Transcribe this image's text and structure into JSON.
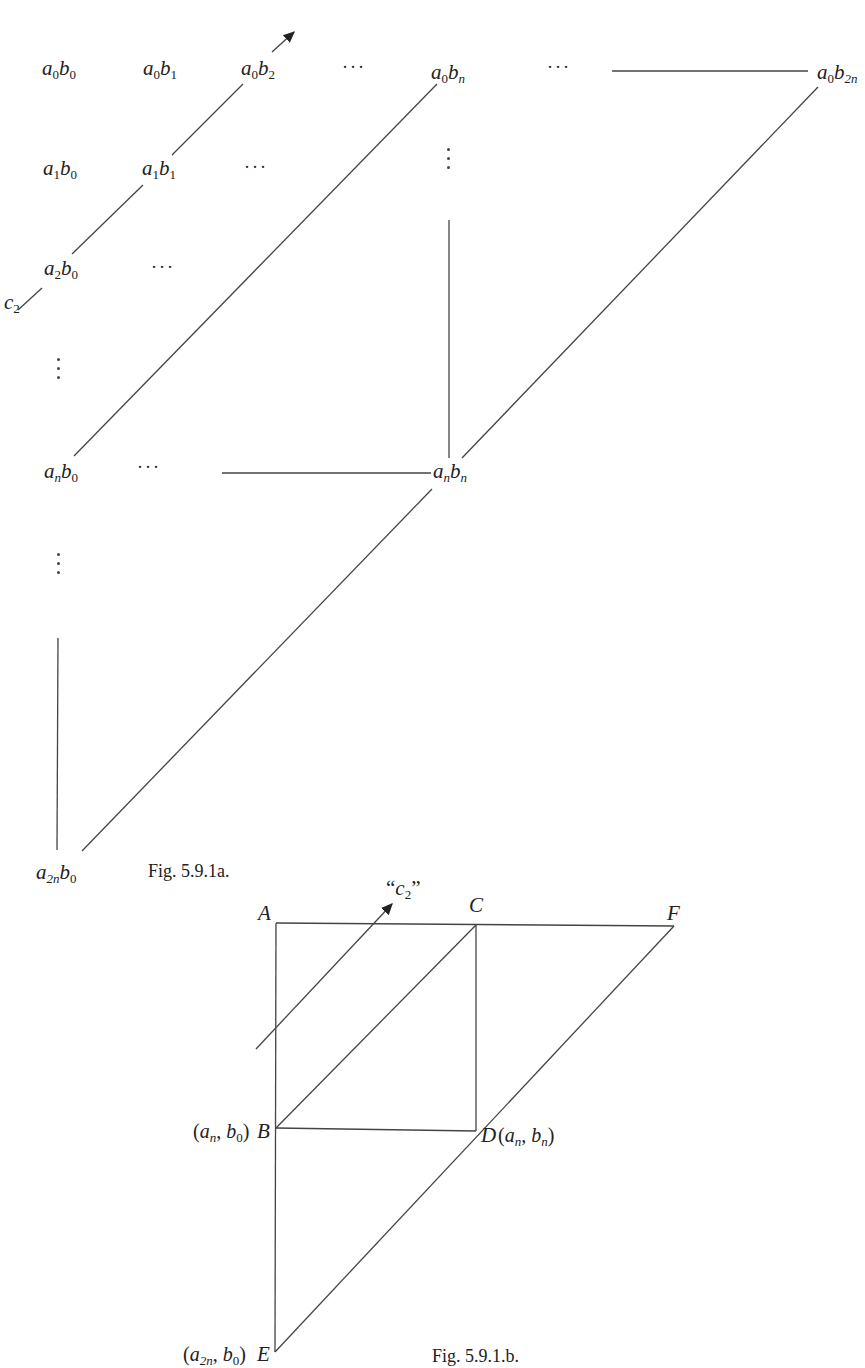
{
  "figure_a": {
    "caption": "Fig. 5.9.1a.",
    "terms": [
      {
        "id": "a0b0",
        "a": "0",
        "b": "0"
      },
      {
        "id": "a0b1",
        "a": "0",
        "b": "1"
      },
      {
        "id": "a0b2",
        "a": "0",
        "b": "2"
      },
      {
        "id": "a0bn",
        "a": "0",
        "b": "n"
      },
      {
        "id": "a0b2n",
        "a": "0",
        "b": "2n"
      },
      {
        "id": "a1b0",
        "a": "1",
        "b": "0"
      },
      {
        "id": "a1b1",
        "a": "1",
        "b": "1"
      },
      {
        "id": "a2b0",
        "a": "2",
        "b": "0"
      },
      {
        "id": "anb0",
        "a": "n",
        "b": "0"
      },
      {
        "id": "anbn",
        "a": "n",
        "b": "n"
      },
      {
        "id": "a2nb0",
        "a": "2n",
        "b": "0"
      }
    ],
    "diagonal_label": {
      "base": "c",
      "sub": "2"
    },
    "ellipsis": "···"
  },
  "figure_b": {
    "caption": "Fig. 5.9.1.b.",
    "diagonal_label": {
      "open": "“",
      "base": "c",
      "sub": "2",
      "close": "”"
    },
    "points": {
      "A": "A",
      "B": "B",
      "C": "C",
      "D": "D",
      "E": "E",
      "F": "F"
    },
    "coords": {
      "B": {
        "a": "n",
        "b": "0"
      },
      "D": {
        "a": "n",
        "b": "n"
      },
      "E": {
        "a": "2n",
        "b": "0"
      }
    }
  }
}
